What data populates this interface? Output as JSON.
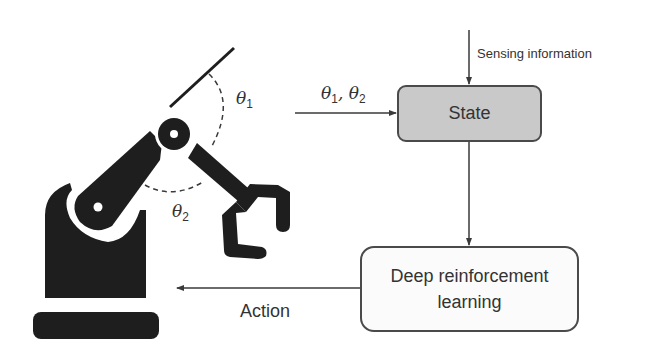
{
  "diagram": {
    "nodes": {
      "state": {
        "label": "State",
        "fill": "#c9c9c9"
      },
      "drl": {
        "label_line1": "Deep reinforcement",
        "label_line2": "learning",
        "fill": "#fbfbfb"
      }
    },
    "edges": {
      "sensing": {
        "label": "Sensing information"
      },
      "angles": {
        "label_theta": "θ",
        "sub1": "1",
        "sep": ", ",
        "sub2": "2"
      },
      "action": {
        "label": "Action"
      }
    },
    "robot": {
      "angle1": {
        "symbol": "θ",
        "sub": "1"
      },
      "angle2": {
        "symbol": "θ",
        "sub": "2"
      }
    },
    "colors": {
      "robot": "#1e1e1e",
      "line": "#3a3a3a"
    }
  }
}
